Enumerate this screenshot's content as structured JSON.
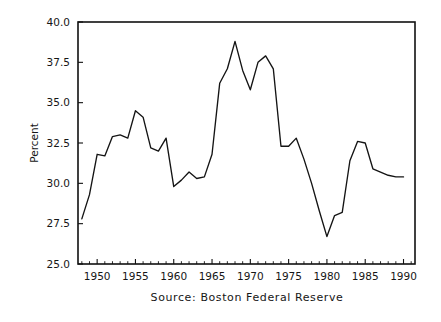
{
  "chart_data": {
    "type": "line",
    "title": "",
    "subtitle": "",
    "xlabel": "",
    "ylabel": "Percent",
    "caption": "Source:  Boston  Federal  Reserve",
    "grid": false,
    "legend": false,
    "legend_position": "none",
    "line_color": "#141414",
    "frame_color": "#111111",
    "background_color": "#ffffff",
    "xlim": [
      1947.5,
      1991.5
    ],
    "ylim": [
      25.0,
      40.0
    ],
    "ytick_labels": [
      "25.0",
      "27.5",
      "30.0",
      "32.5",
      "35.0",
      "37.5",
      "40.0"
    ],
    "ytick_values": [
      25.0,
      27.5,
      30.0,
      32.5,
      35.0,
      37.5,
      40.0
    ],
    "xtick_labels": [
      "1950",
      "1955",
      "1960",
      "1965",
      "1970",
      "1975",
      "1980",
      "1985",
      "1990"
    ],
    "xtick_values": [
      1950,
      1955,
      1960,
      1965,
      1970,
      1975,
      1980,
      1985,
      1990
    ],
    "x_minor_interval": 1,
    "series": [
      {
        "name": "Percent",
        "x": [
          1948,
          1949,
          1950,
          1951,
          1952,
          1953,
          1954,
          1955,
          1956,
          1957,
          1958,
          1959,
          1960,
          1961,
          1962,
          1963,
          1964,
          1965,
          1966,
          1967,
          1968,
          1969,
          1970,
          1971,
          1972,
          1973,
          1974,
          1975,
          1976,
          1977,
          1978,
          1979,
          1980,
          1981,
          1982,
          1983,
          1984,
          1985,
          1986,
          1987,
          1988,
          1989,
          1990
        ],
        "values": [
          27.8,
          29.3,
          31.8,
          31.7,
          32.9,
          33.0,
          32.8,
          34.5,
          34.1,
          32.2,
          32.0,
          32.8,
          29.8,
          30.2,
          30.7,
          30.3,
          30.4,
          31.8,
          36.2,
          37.1,
          38.8,
          37.0,
          35.8,
          37.5,
          37.9,
          37.1,
          32.3,
          32.3,
          32.8,
          31.5,
          30.0,
          28.3,
          26.7,
          28.0,
          28.2,
          31.4,
          32.6,
          32.5,
          30.9,
          30.7,
          30.5,
          30.4,
          30.4
        ]
      }
    ]
  },
  "figure": {
    "ylabel": "Percent",
    "caption": "Source:  Boston  Federal  Reserve"
  }
}
